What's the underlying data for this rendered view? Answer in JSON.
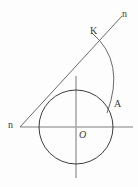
{
  "figure": {
    "type": "geometry-diagram",
    "width": 138,
    "height": 187,
    "background_color": "#fdfdfd",
    "stroke_color": "#3c3c3c",
    "axis_color": "#a8a8a8",
    "label_color": "#3a3a3a",
    "circle": {
      "name": "main-circle",
      "center_x": 76,
      "center_y": 127,
      "radius": 37
    },
    "axes": {
      "horizontal": {
        "x1": 20,
        "y1": 127,
        "x2": 133,
        "y2": 127
      },
      "vertical": {
        "x1": 76,
        "y1": 76,
        "x2": 76,
        "y2": 178
      }
    },
    "tangent_line": {
      "name": "line-n",
      "x1": 20,
      "y1": 127,
      "x2": 122,
      "y2": 16
    },
    "arc": {
      "name": "arc-K-A",
      "start_x": 92,
      "start_y": 33,
      "control_x": 124,
      "control_y": 64,
      "end_x": 107,
      "end_y": 113
    },
    "labels": [
      {
        "id": "n-top",
        "text": "n",
        "x": 124,
        "y": 13,
        "italic": false
      },
      {
        "id": "K",
        "text": "K",
        "x": 94,
        "y": 31,
        "italic": false
      },
      {
        "id": "A",
        "text": "A",
        "x": 117,
        "y": 104,
        "italic": false
      },
      {
        "id": "n-left",
        "text": "n",
        "x": 12,
        "y": 125,
        "italic": false
      },
      {
        "id": "O",
        "text": "O",
        "x": 82,
        "y": 135,
        "italic": true
      }
    ]
  }
}
